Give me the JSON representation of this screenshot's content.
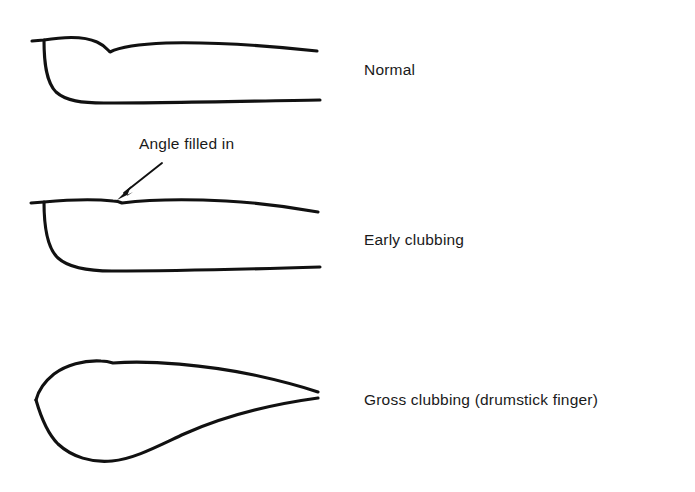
{
  "figure": {
    "background_color": "#ffffff",
    "stroke_color": "#111111",
    "width": 695,
    "height": 492
  },
  "annotation": {
    "text": "Angle filled in",
    "target": "early-clubbing-nailfold-angle",
    "arrow_from": [
      162,
      163
    ],
    "arrow_to": [
      118,
      199
    ]
  },
  "panels": [
    {
      "id": "normal",
      "label": "Normal",
      "label_position": [
        364,
        61
      ],
      "description": "Normal finger profile with a distinct notch at the nail fold, showing a normal Lovibond angle of about 160 degrees.",
      "nail_path": "M 32 41 L 44 40 C 62 37 84 36 97 42 C 104 45 107 49 110 52 C 120 47 140 44 166 43 C 214 42 272 46 317 51",
      "skin_path": "M 44 40 C 44 62 46 82 56 92 C 66 101 82 103 104 103 C 160 103 252 101 320 100",
      "notch": [
        110,
        52
      ]
    },
    {
      "id": "early",
      "label": "Early clubbing",
      "label_position": [
        364,
        231
      ],
      "description": "Early clubbing: the nail fold angle is filled in so the nail and skin form a nearly straight line.",
      "nail_path": "M 31 203 L 44 202 C 66 200 94 199 113 201 C 118 201 120 202 122 203 C 146 200 186 199 226 201 C 262 203 296 208 318 212",
      "skin_path": "M 44 202 C 44 226 47 248 58 258 C 69 268 88 271 112 271 C 166 271 254 269 320 267",
      "notch": [
        118,
        202
      ]
    },
    {
      "id": "gross",
      "label": "Gross clubbing (drumstick finger)",
      "label_position": [
        364,
        391
      ],
      "description": "Gross clubbing, also called drumstick finger: the terminal phalanx is bulbous and the nail is convex and beaked.",
      "nail_path": "M 36 400 C 38 392 44 382 54 374 C 66 365 84 360 101 361 C 106 361 110 362 113 363 C 150 360 206 365 254 375 C 286 382 306 388 318 392",
      "skin_path": "M 36 400 C 40 414 46 432 58 444 C 72 457 92 463 112 461 C 134 459 158 446 184 434 C 224 416 274 404 318 398",
      "notch": [
        37,
        399
      ]
    }
  ]
}
